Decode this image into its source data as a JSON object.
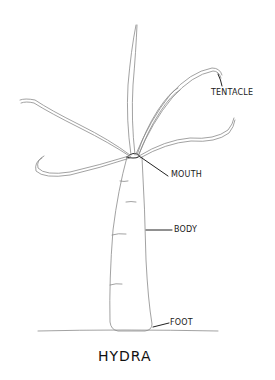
{
  "diagram": {
    "title": "HYDRA",
    "style": "pencil line drawing",
    "labels": [
      {
        "id": "tentacle",
        "text": "TENTACLE"
      },
      {
        "id": "mouth",
        "text": "MOUTH"
      },
      {
        "id": "body",
        "text": "BODY"
      },
      {
        "id": "foot",
        "text": "FOOT"
      }
    ],
    "colors": {
      "background": "#ffffff",
      "sketch_line": "#8a8a8a",
      "text": "#1a1a1a"
    }
  }
}
